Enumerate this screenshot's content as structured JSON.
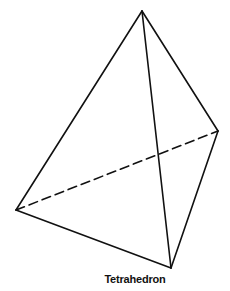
{
  "figure": {
    "caption": "Tetrahedron",
    "stroke_color": "#111111",
    "background": "#ffffff",
    "vertices": {
      "apex": [
        142,
        11
      ],
      "right": [
        218,
        131
      ],
      "left": [
        16,
        210
      ],
      "bottom": [
        171,
        268
      ]
    },
    "edges": {
      "solid": [
        [
          "apex",
          "left"
        ],
        [
          "apex",
          "bottom"
        ],
        [
          "apex",
          "right"
        ],
        [
          "left",
          "bottom"
        ],
        [
          "right",
          "bottom"
        ]
      ],
      "dashed": [
        [
          "left",
          "right"
        ]
      ]
    }
  }
}
